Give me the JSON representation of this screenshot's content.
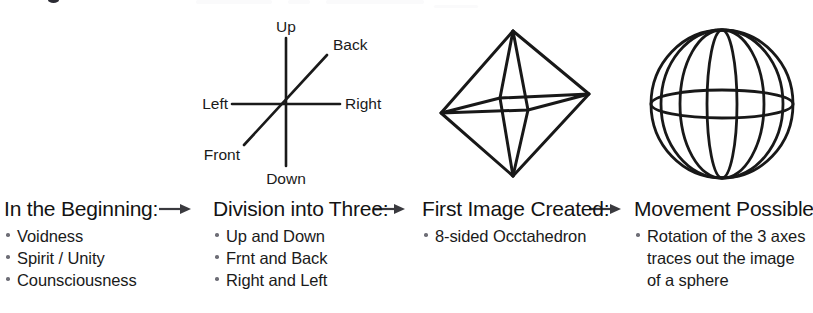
{
  "page": {
    "title_remnant": "",
    "background_color": "#ffffff",
    "ink_color": "#141414",
    "bullet_color": "#6e6e76"
  },
  "diagrams": [
    {
      "name": "three-axes",
      "labels": {
        "up": "Up",
        "down": "Down",
        "left": "Left",
        "right": "Right",
        "front": "Front",
        "back": "Back"
      }
    },
    {
      "name": "octahedron",
      "labels": {}
    },
    {
      "name": "sphere",
      "labels": {}
    }
  ],
  "columns": [
    {
      "heading": "In the Beginning:",
      "bullets": [
        {
          "line1": "Voidness",
          "line2": "",
          "line3": ""
        },
        {
          "line1": "Spirit / Unity",
          "line2": "",
          "line3": ""
        },
        {
          "line1": "Counsciousness",
          "line2": "",
          "line3": ""
        }
      ]
    },
    {
      "heading": "Division into Three:",
      "bullets": [
        {
          "line1": "Up and Down",
          "line2": "",
          "line3": ""
        },
        {
          "line1": "Frnt and Back",
          "line2": "",
          "line3": ""
        },
        {
          "line1": "Right and Left",
          "line2": "",
          "line3": ""
        }
      ]
    },
    {
      "heading": "First Image Created:",
      "bullets": [
        {
          "line1": "8-sided Occtahedron",
          "line2": "",
          "line3": ""
        }
      ]
    },
    {
      "heading": "Movement Possible:",
      "bullets": [
        {
          "line1": "Rotation of the 3 axes",
          "line2": "traces out the image",
          "line3": "of a sphere"
        }
      ]
    }
  ],
  "arrows": [
    {
      "name": "arrow-beginning-to-division",
      "glyph": "arrow-right-icon"
    },
    {
      "name": "arrow-division-to-first-image",
      "glyph": "arrow-right-icon"
    },
    {
      "name": "arrow-first-image-to-movement",
      "glyph": "arrow-right-icon"
    }
  ]
}
